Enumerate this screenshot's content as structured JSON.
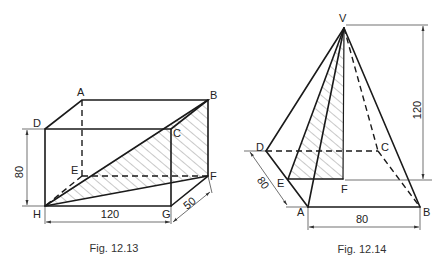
{
  "figures": [
    {
      "caption": "Fig. 12.13",
      "type": "rectangular prism with shaded diagonal plane",
      "vertices": {
        "A": "A",
        "B": "B",
        "C": "C",
        "D": "D",
        "E": "E",
        "F": "F",
        "G": "G",
        "H": "H"
      },
      "dimensions": {
        "height": "80",
        "length": "120",
        "depth": "50"
      }
    },
    {
      "caption": "Fig. 12.14",
      "type": "square pyramid with shaded triangle",
      "vertices": {
        "V": "V",
        "A": "A",
        "B": "B",
        "C": "C",
        "D": "D",
        "E": "E",
        "F": "F"
      },
      "dimensions": {
        "height": "120",
        "base_side": "80",
        "base_depth": "80"
      }
    }
  ]
}
